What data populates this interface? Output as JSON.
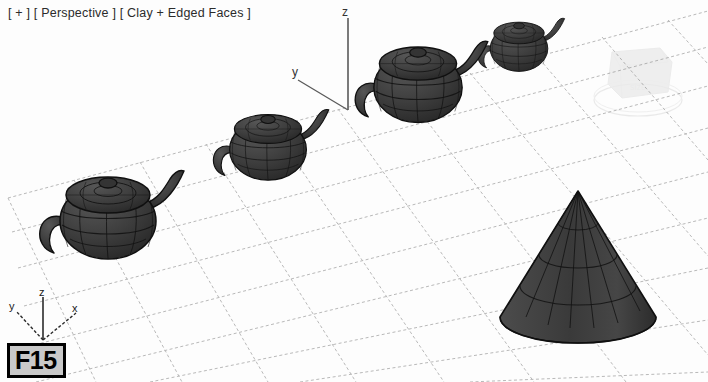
{
  "viewport": {
    "label_full": "[ + ] [ Perspective ] [ Clay + Edged Faces ]",
    "view_corner": "+",
    "view_type": "Perspective",
    "shading_mode": "Clay + Edged Faces",
    "background_color": "#fdfdfd",
    "grid_color": "#b9b9b9"
  },
  "figure": {
    "label": "F15"
  },
  "world_gizmo": {
    "z_label": "z",
    "y_label": "y"
  },
  "axis_tripod": {
    "z_label": "z",
    "y_label": "y",
    "x_label": "x"
  },
  "scene": {
    "object_fill": "#3d3d3d",
    "object_edge": "#0f0f0f",
    "objects": [
      {
        "name": "teapot-1-near",
        "type": "teapot",
        "cx": 108,
        "cy": 215,
        "scale": 1.0
      },
      {
        "name": "teapot-2",
        "type": "teapot",
        "cx": 268,
        "cy": 145,
        "scale": 0.8
      },
      {
        "name": "teapot-3",
        "type": "teapot",
        "cx": 418,
        "cy": 82,
        "scale": 0.92
      },
      {
        "name": "teapot-4-far",
        "type": "teapot",
        "cx": 519,
        "cy": 45,
        "scale": 0.6
      },
      {
        "name": "cone",
        "type": "cone",
        "cx": 578,
        "cy": 265,
        "scale": 1.0
      },
      {
        "name": "ghost-object",
        "type": "ghost",
        "cx": 640,
        "cy": 80,
        "scale": 1.0
      }
    ]
  }
}
